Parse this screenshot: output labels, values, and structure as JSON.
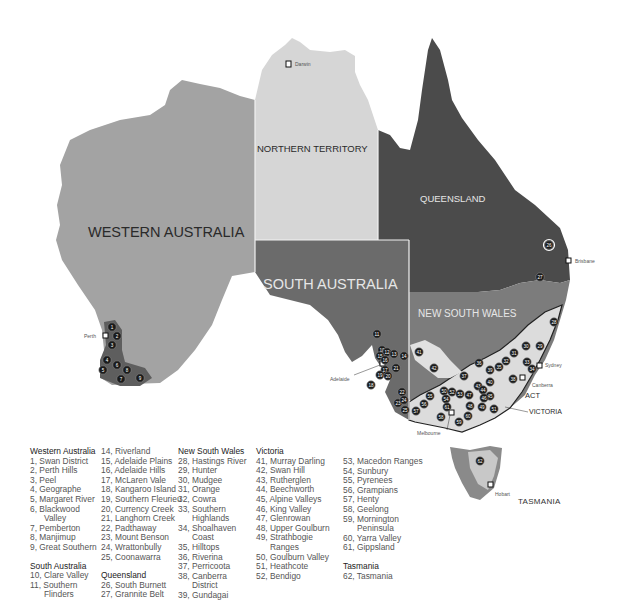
{
  "states": {
    "western_australia": {
      "label": "WESTERN AUSTRALIA",
      "color": "#a3a3a3"
    },
    "northern_territory": {
      "label": "NORTHERN TERRITORY",
      "color": "#d6d6d6"
    },
    "queensland": {
      "label": "QUEENSLAND",
      "color": "#4b4b4b"
    },
    "south_australia": {
      "label": "SOUTH AUSTRALIA",
      "color": "#6b6b6b"
    },
    "new_south_wales": {
      "label": "NEW SOUTH WALES",
      "color": "#7c7c7c"
    },
    "victoria": {
      "label": "VICTORIA"
    },
    "act": {
      "label": "ACT"
    },
    "tasmania": {
      "label": "TASMANIA"
    }
  },
  "cities": {
    "darwin": "Darwin",
    "brisbane": "Brisbane",
    "sydney": "Sydney",
    "canberra": "Canberra",
    "melbourne": "Melbourne",
    "adelaide": "Adelaide",
    "perth": "Perth",
    "hobart": "Hobart"
  },
  "legend": {
    "col1": {
      "wa_heading": "Western Australia",
      "wa": [
        "1, Swan District",
        "2, Perth Hills",
        "3, Peel",
        "4, Geographe",
        "5, Margaret River",
        "6, Blackwood",
        "Valley",
        "7, Pemberton",
        "8, Manjimup",
        "9, Great Southern"
      ],
      "sa_heading": "South Australia",
      "sa": [
        "10, Clare Valley",
        "11, Southern",
        "Flinders"
      ]
    },
    "col2": {
      "sa_cont": [
        "14, Riverland",
        "15, Adelaide Plains",
        "16, Adelaide Hills",
        "17, McLaren Vale",
        "18, Kangaroo Island",
        "19, Southern Fleurieu",
        "20, Currency Creek",
        "21, Langhorn Creek",
        "22, Padthaway",
        "23, Mount Benson",
        "24, Wrattonbully",
        "25, Coonawarra"
      ],
      "qld_heading": "Queensland",
      "qld": [
        "26, South Burnett",
        "27, Grannite Belt"
      ]
    },
    "col3": {
      "nsw_heading": "New South Wales",
      "nsw": [
        "28, Hastings River",
        "29, Hunter",
        "30, Mudgee",
        "31, Orange",
        "32, Cowra",
        "33, Southern",
        "Highlands",
        "34, Shoalhaven",
        "Coast",
        "35, Hilltops",
        "36, Riverina",
        "37, Perricoota",
        "38, Canberra",
        "District",
        "39, Gundagai"
      ]
    },
    "col4": {
      "vic_heading": "Victoria",
      "vic": [
        "41, Murray Darling",
        "42, Swan Hill",
        "43, Rutherglen",
        "44, Beechworth",
        "45, Alpine Valleys",
        "46, King Valley",
        "47, Glenrowan",
        "48, Upper Goulburn",
        "49, Strathbogie",
        "Ranges",
        "50, Goulburn Valley",
        "51, Heathcote",
        "52, Bendigo"
      ]
    },
    "col5": {
      "vic_cont": [
        "53, Macedon Ranges",
        "54, Sunbury",
        "55, Pyrenees",
        "56, Grampians",
        "57, Henty",
        "58, Geelong",
        "59, Mornington",
        "Peninsula",
        "60, Yarra Valley",
        "61, Gippsland"
      ],
      "tas_heading": "Tasmania",
      "tas": [
        "62, Tasmania"
      ]
    }
  },
  "pins": [
    {
      "n": "1",
      "x": 112,
      "y": 327
    },
    {
      "n": "2",
      "x": 117,
      "y": 336
    },
    {
      "n": "3",
      "x": 112,
      "y": 345
    },
    {
      "n": "4",
      "x": 107,
      "y": 360
    },
    {
      "n": "5",
      "x": 103,
      "y": 370
    },
    {
      "n": "6",
      "x": 117,
      "y": 365
    },
    {
      "n": "7",
      "x": 121,
      "y": 379
    },
    {
      "n": "8",
      "x": 127,
      "y": 370
    },
    {
      "n": "9",
      "x": 140,
      "y": 378
    },
    {
      "n": "10",
      "x": 382,
      "y": 350
    },
    {
      "n": "11",
      "x": 377,
      "y": 334
    },
    {
      "n": "12",
      "x": 387,
      "y": 352
    },
    {
      "n": "13",
      "x": 394,
      "y": 354
    },
    {
      "n": "14",
      "x": 404,
      "y": 356
    },
    {
      "n": "15",
      "x": 380,
      "y": 356
    },
    {
      "n": "16",
      "x": 385,
      "y": 360
    },
    {
      "n": "17",
      "x": 385,
      "y": 370
    },
    {
      "n": "18",
      "x": 371,
      "y": 385
    },
    {
      "n": "19",
      "x": 380,
      "y": 375
    },
    {
      "n": "20",
      "x": 388,
      "y": 376
    },
    {
      "n": "21",
      "x": 396,
      "y": 368
    },
    {
      "n": "22",
      "x": 402,
      "y": 392
    },
    {
      "n": "23",
      "x": 398,
      "y": 403
    },
    {
      "n": "24",
      "x": 404,
      "y": 400
    },
    {
      "n": "25",
      "x": 405,
      "y": 410
    },
    {
      "n": "26",
      "x": 549,
      "y": 245
    },
    {
      "n": "27",
      "x": 540,
      "y": 277
    },
    {
      "n": "28",
      "x": 554,
      "y": 322
    },
    {
      "n": "29",
      "x": 540,
      "y": 346
    },
    {
      "n": "30",
      "x": 526,
      "y": 346
    },
    {
      "n": "31",
      "x": 514,
      "y": 353
    },
    {
      "n": "32",
      "x": 506,
      "y": 361
    },
    {
      "n": "33",
      "x": 527,
      "y": 362
    },
    {
      "n": "34",
      "x": 532,
      "y": 369
    },
    {
      "n": "35",
      "x": 499,
      "y": 367
    },
    {
      "n": "36",
      "x": 479,
      "y": 363
    },
    {
      "n": "37",
      "x": 464,
      "y": 376
    },
    {
      "n": "38",
      "x": 513,
      "y": 379
    },
    {
      "n": "39",
      "x": 490,
      "y": 370
    },
    {
      "n": "40",
      "x": 490,
      "y": 382
    },
    {
      "n": "41",
      "x": 419,
      "y": 352
    },
    {
      "n": "42",
      "x": 434,
      "y": 368
    },
    {
      "n": "43",
      "x": 478,
      "y": 386
    },
    {
      "n": "44",
      "x": 483,
      "y": 390
    },
    {
      "n": "45",
      "x": 490,
      "y": 396
    },
    {
      "n": "46",
      "x": 484,
      "y": 398
    },
    {
      "n": "47",
      "x": 469,
      "y": 395
    },
    {
      "n": "48",
      "x": 470,
      "y": 406
    },
    {
      "n": "49",
      "x": 482,
      "y": 407
    },
    {
      "n": "50",
      "x": 444,
      "y": 391
    },
    {
      "n": "51",
      "x": 494,
      "y": 409
    },
    {
      "n": "52",
      "x": 452,
      "y": 392
    },
    {
      "n": "53",
      "x": 460,
      "y": 394
    },
    {
      "n": "54",
      "x": 446,
      "y": 399
    },
    {
      "n": "55",
      "x": 430,
      "y": 396
    },
    {
      "n": "56",
      "x": 424,
      "y": 404
    },
    {
      "n": "57",
      "x": 416,
      "y": 411
    },
    {
      "n": "58",
      "x": 441,
      "y": 417
    },
    {
      "n": "59",
      "x": 459,
      "y": 422
    },
    {
      "n": "60",
      "x": 468,
      "y": 416
    },
    {
      "n": "61",
      "x": 447,
      "y": 407
    },
    {
      "n": "62",
      "x": 480,
      "y": 461
    }
  ]
}
